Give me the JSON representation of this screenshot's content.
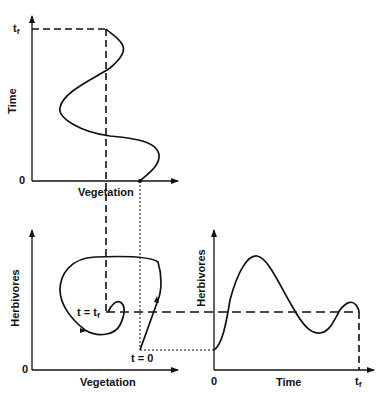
{
  "diagram": {
    "top_panel": {
      "y_label": "Time",
      "x_label": "Vegetation",
      "y_tick_top": "t",
      "y_tick_top_sub": "f",
      "y_tick_origin": "0"
    },
    "bottom_left_panel": {
      "y_label": "Herbivores",
      "x_label": "Vegetation",
      "origin": "0",
      "start_label": "t = 0",
      "end_label": "t = t",
      "end_label_sub": "f"
    },
    "bottom_right_panel": {
      "y_label": "Herbivores",
      "x_label": "Time",
      "x_tick_origin": "0",
      "x_tick_end": "t",
      "x_tick_end_sub": "f"
    },
    "colors": {
      "line": "#111111",
      "background": "#ffffff"
    }
  }
}
